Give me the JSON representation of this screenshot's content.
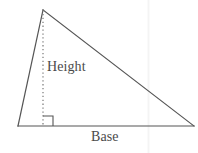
{
  "figure": {
    "kind": "geometry-diagram",
    "background_color": "#ffffff",
    "stroke_color": "#555555",
    "text_color": "#4a4a4a",
    "faint_line_color": "#f2f2f2",
    "labels": {
      "height": "Height",
      "base": "Base"
    },
    "geometry": {
      "apex": [
        43,
        10
      ],
      "bottom_left": [
        18,
        126
      ],
      "bottom_right": [
        194,
        126
      ],
      "altitude_foot": [
        43,
        126
      ],
      "right_angle_marker": {
        "x": 43,
        "y": 116,
        "size": 10
      },
      "vertical_guide_x": 148
    },
    "element_names": {
      "left_side": "triangle-left-side",
      "hypotenuse": "triangle-hypotenuse",
      "base_line": "triangle-base-line",
      "altitude": "altitude-dotted-line",
      "right_angle": "right-angle-marker",
      "guide": "faint-vertical-guide"
    }
  }
}
